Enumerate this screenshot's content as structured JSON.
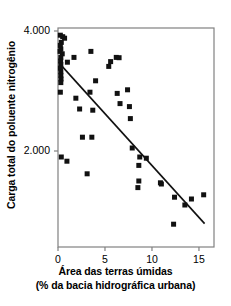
{
  "chart_data": {
    "type": "scatter",
    "title": "",
    "xlabel": "Área das terras úmidas",
    "xlabel_line2": "(% da bacia hidrográfica urbana)",
    "ylabel": "Carga total do poluente nitrogênio",
    "xlim": [
      0,
      16.6
    ],
    "ylim": [
      400,
      4050
    ],
    "xticks": [
      0,
      5,
      10,
      15
    ],
    "xticklabels": [
      "0",
      "5",
      "10",
      "15"
    ],
    "yticks": [
      2000,
      4000
    ],
    "yticklabels": [
      "2.000",
      "4.000"
    ],
    "grid": false,
    "legend": null,
    "marker": "square",
    "marker_color": "#111111",
    "marker_size_px": 5,
    "axis_color": "#777777",
    "trendline": {
      "type": "linear",
      "color": "#111111",
      "width_px": 1.6,
      "x_start": 0.15,
      "y_start": 3460,
      "x_end": 15.6,
      "y_end": 790
    },
    "points": [
      [
        0.25,
        3930
      ],
      [
        0.5,
        3905
      ],
      [
        0.7,
        3880
      ],
      [
        0.35,
        3810
      ],
      [
        0.25,
        3760
      ],
      [
        0.3,
        3700
      ],
      [
        0.22,
        3660
      ],
      [
        0.45,
        3620
      ],
      [
        0.3,
        3560
      ],
      [
        0.28,
        3500
      ],
      [
        0.3,
        3440
      ],
      [
        0.26,
        3380
      ],
      [
        0.3,
        3320
      ],
      [
        0.3,
        3260
      ],
      [
        0.32,
        3200
      ],
      [
        0.3,
        3140
      ],
      [
        0.25,
        2980
      ],
      [
        1.0,
        3480
      ],
      [
        1.7,
        3560
      ],
      [
        3.5,
        3660
      ],
      [
        5.6,
        3490
      ],
      [
        6.2,
        3560
      ],
      [
        6.5,
        3555
      ],
      [
        5.4,
        3410
      ],
      [
        4.0,
        3170
      ],
      [
        6.3,
        2960
      ],
      [
        7.4,
        3020
      ],
      [
        1.9,
        2880
      ],
      [
        3.4,
        2980
      ],
      [
        6.6,
        2790
      ],
      [
        7.6,
        2740
      ],
      [
        3.7,
        2680
      ],
      [
        2.3,
        2700
      ],
      [
        7.7,
        2540
      ],
      [
        2.6,
        2230
      ],
      [
        3.6,
        2230
      ],
      [
        7.9,
        2050
      ],
      [
        8.7,
        1900
      ],
      [
        9.4,
        1880
      ],
      [
        8.6,
        1760
      ],
      [
        0.35,
        1900
      ],
      [
        0.95,
        1830
      ],
      [
        3.1,
        1620
      ],
      [
        8.6,
        1500
      ],
      [
        8.5,
        1390
      ],
      [
        10.9,
        1470
      ],
      [
        11.0,
        1450
      ],
      [
        12.4,
        1230
      ],
      [
        13.5,
        1100
      ],
      [
        12.3,
        780
      ],
      [
        14.2,
        1200
      ],
      [
        15.5,
        1270
      ]
    ]
  }
}
